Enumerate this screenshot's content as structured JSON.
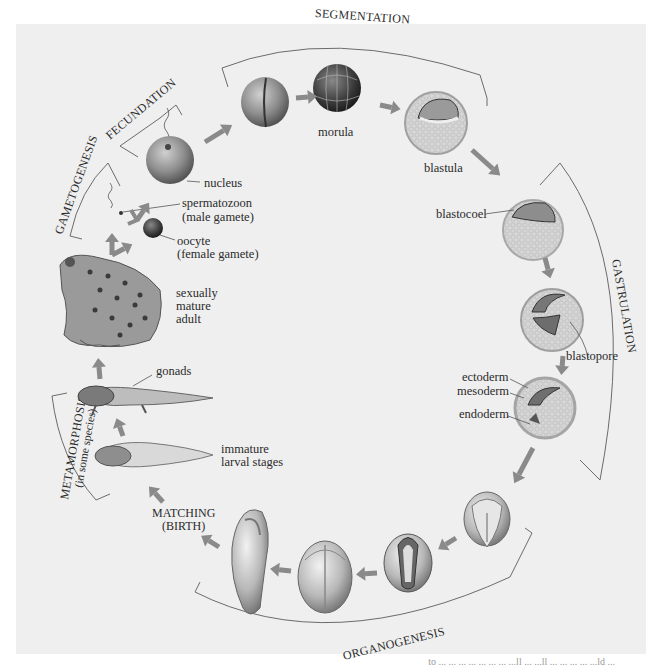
{
  "figure": {
    "stages": [
      {
        "id": "fecundation",
        "label": "FECUNDATION"
      },
      {
        "id": "segmentation",
        "label": "SEGMENTATION"
      },
      {
        "id": "gastrulation",
        "label": "GASTRULATION"
      },
      {
        "id": "organogenesis",
        "label": "ORGANOGENESIS"
      },
      {
        "id": "metamorphosis",
        "label": "METAMORPHOSIS",
        "sublabel": "(in some species)"
      },
      {
        "id": "gametogenesis",
        "label": "GAMETOGENESIS"
      }
    ],
    "labels": {
      "nucleus": "nucleus",
      "spermatozoon": "spermatozoon",
      "spermatozoon_note": "(male gamete)",
      "oocyte": "oocyte",
      "oocyte_note": "(female gamete)",
      "adult_1": "sexually",
      "adult_2": "mature",
      "adult_3": "adult",
      "gonads": "gonads",
      "larval_1": "immature",
      "larval_2": "larval stages",
      "hatching_1": "MATCHING",
      "hatching_2": "(BIRTH)",
      "morula": "morula",
      "blastula": "blastula",
      "blastocoel": "blastocoel",
      "blastopore": "blastopore",
      "ectoderm": "ectoderm",
      "mesoderm": "mesoderm",
      "endoderm": "endoderm"
    },
    "colors": {
      "panel": "#efefef",
      "arrow": "#8a8a8a",
      "egg": "#8f8f8f",
      "cells": "#d8d8d8",
      "bracket": "#6b6b6b"
    }
  },
  "footer": {
    "cutoff_text": "to ... ... ... ... ... ... ... ...ll ... ...ll ... ... ... ... ...ld ..."
  }
}
